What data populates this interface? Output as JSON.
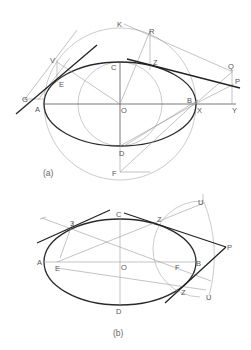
{
  "figure_a": {
    "caption": "(a)",
    "labels": {
      "K": "K",
      "R": "R",
      "V": "V",
      "C": "C",
      "Z": "Z",
      "Q": "Q",
      "P": "P",
      "E": "E",
      "G": "G",
      "A": "A",
      "O": "O",
      "B": "B",
      "X": "X",
      "Y": "Y",
      "D": "D",
      "F": "F"
    }
  },
  "figure_b": {
    "caption": "(b)",
    "labels": {
      "C": "C",
      "three": "3",
      "Z_top": "Z",
      "U_top": "U",
      "P": "P",
      "A": "A",
      "E": "E",
      "O": "O",
      "F": "F",
      "B": "B",
      "Z_bottom": "Z",
      "U_bottom": "U",
      "D": "D"
    }
  }
}
